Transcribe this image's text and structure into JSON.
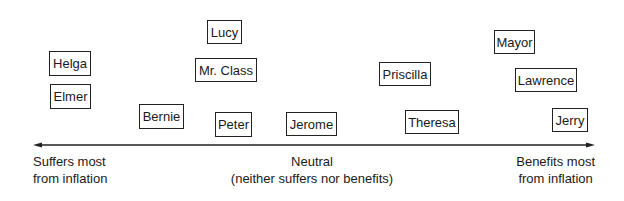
{
  "diagram": {
    "type": "spectrum",
    "axis": {
      "direction": "bidirectional",
      "left_label": [
        "Suffers most",
        "from inflation"
      ],
      "center_label": [
        "Neutral",
        "(neither suffers nor benefits)"
      ],
      "right_label": [
        "Benefits most",
        "from inflation"
      ]
    },
    "people": [
      {
        "name": "Helga",
        "x": 49,
        "y": 51,
        "w": 42,
        "h": 25
      },
      {
        "name": "Elmer",
        "x": 50,
        "y": 84,
        "w": 41,
        "h": 25
      },
      {
        "name": "Bernie",
        "x": 139,
        "y": 104,
        "w": 45,
        "h": 25
      },
      {
        "name": "Lucy",
        "x": 207,
        "y": 20,
        "w": 35,
        "h": 24
      },
      {
        "name": "Mr. Class",
        "x": 195,
        "y": 58,
        "w": 62,
        "h": 24
      },
      {
        "name": "Peter",
        "x": 215,
        "y": 112,
        "w": 37,
        "h": 25
      },
      {
        "name": "Jerome",
        "x": 286,
        "y": 112,
        "w": 51,
        "h": 24
      },
      {
        "name": "Priscilla",
        "x": 379,
        "y": 62,
        "w": 52,
        "h": 24
      },
      {
        "name": "Theresa",
        "x": 405,
        "y": 110,
        "w": 54,
        "h": 24
      },
      {
        "name": "Mayor",
        "x": 494,
        "y": 30,
        "w": 41,
        "h": 24
      },
      {
        "name": "Lawrence",
        "x": 515,
        "y": 68,
        "w": 62,
        "h": 24
      },
      {
        "name": "Jerry",
        "x": 552,
        "y": 108,
        "w": 36,
        "h": 24
      }
    ]
  }
}
